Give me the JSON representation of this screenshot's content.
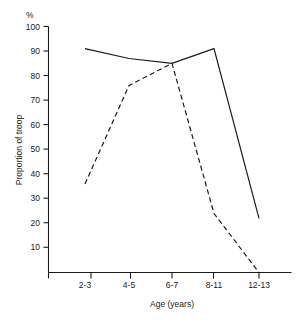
{
  "chart_data": {
    "type": "line",
    "title": "",
    "xlabel": "Age (years)",
    "ylabel": "Proportion of troop",
    "yunit": "%",
    "categories": [
      "2-3",
      "4-5",
      "6-7",
      "8-11",
      "12-13"
    ],
    "ylim": [
      0,
      100
    ],
    "ytick_labels": [
      "10",
      "20",
      "30",
      "40",
      "50",
      "60",
      "70",
      "80",
      "90",
      "100"
    ],
    "ytick_values": [
      10,
      20,
      30,
      40,
      50,
      60,
      70,
      80,
      90,
      100
    ],
    "grid": false,
    "legend": "none",
    "series": [
      {
        "name": "solid-line",
        "style": "solid",
        "color": "#1a1a1a",
        "values": [
          91,
          87,
          85,
          91,
          22
        ]
      },
      {
        "name": "dashed-line",
        "style": "dashed",
        "color": "#1a1a1a",
        "values": [
          36,
          76,
          85,
          24,
          0
        ]
      }
    ]
  },
  "axes": {
    "y_unit_label": "%",
    "y_axis_title": "Proportion of troop",
    "x_axis_title": "Age (years)",
    "x_tick_labels": [
      "2-3",
      "4-5",
      "6-7",
      "8-11",
      "12-13"
    ],
    "y_tick_labels": [
      "100",
      "90",
      "80",
      "70",
      "60",
      "50",
      "40",
      "30",
      "20",
      "10"
    ]
  }
}
